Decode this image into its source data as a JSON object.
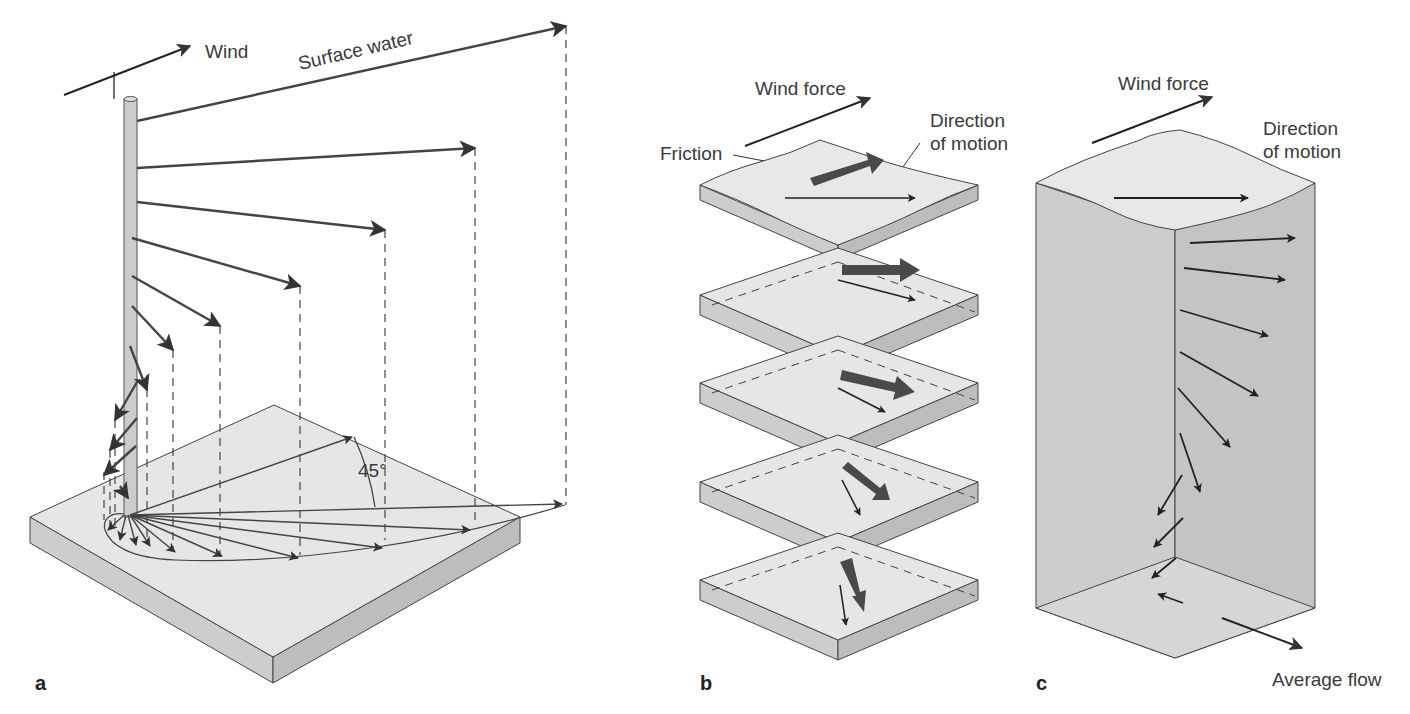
{
  "figure": {
    "colors": {
      "top_face": "#e6e6e6",
      "side_face": "#cdcdcd",
      "side_face_dark": "#bdbdbd",
      "outline": "#444444",
      "arrow": "#222222",
      "friction_arrow": "#4a4a4a",
      "pole": "#cccccc"
    }
  },
  "panel_a": {
    "letter": "a",
    "wind_label": "Wind",
    "surface_water_label": "Surface water",
    "angle_label": "45°"
  },
  "panel_b": {
    "letter": "b",
    "wind_force_label": "Wind force",
    "friction_label": "Friction",
    "direction_label_line1": "Direction",
    "direction_label_line2": "of motion",
    "layer_count": 5
  },
  "panel_c": {
    "letter": "c",
    "wind_force_label": "Wind force",
    "direction_label_line1": "Direction",
    "direction_label_line2": "of motion",
    "average_flow_label": "Average flow"
  }
}
